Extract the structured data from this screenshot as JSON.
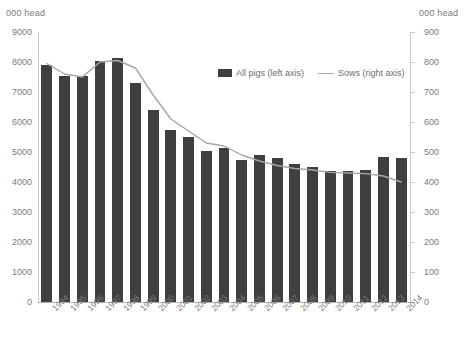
{
  "axes": {
    "left_unit_label": "000 head",
    "right_unit_label": "000 head"
  },
  "legend": {
    "items": [
      {
        "label": "All pigs (left axis)",
        "marker": "bar-swatch",
        "color": "#3f3f3f"
      },
      {
        "label": "Sows (right axis)",
        "marker": "line-swatch",
        "color": "#a6a6a6"
      }
    ]
  },
  "chart_data": {
    "type": "bar",
    "title": "",
    "subtitle": "",
    "xlabel": "",
    "ylabel": "000 head",
    "y2label": "000 head",
    "ylim": [
      0,
      9000
    ],
    "y2lim": [
      0,
      900
    ],
    "yticks": [
      0,
      1000,
      2000,
      3000,
      4000,
      5000,
      6000,
      7000,
      8000,
      9000
    ],
    "y2ticks": [
      0,
      100,
      200,
      300,
      400,
      500,
      600,
      700,
      800,
      900
    ],
    "grid": false,
    "legend_position": "top-center",
    "categories": [
      "1994",
      "1995",
      "1996",
      "1997",
      "1998",
      "1999",
      "2000",
      "2001",
      "2002",
      "2003",
      "2004",
      "2005",
      "2006",
      "2007",
      "2008",
      "2009",
      "2010",
      "2011",
      "2012",
      "2013",
      "2014"
    ],
    "series": [
      {
        "name": "All pigs (left axis)",
        "type": "bar",
        "axis": "left",
        "color": "#3f3f3f",
        "values": [
          7900,
          7550,
          7540,
          8050,
          8120,
          7300,
          6400,
          5750,
          5500,
          5050,
          5150,
          4750,
          4900,
          4800,
          4600,
          4500,
          4370,
          4370,
          4400,
          4850,
          4800
        ]
      },
      {
        "name": "Sows (right axis)",
        "type": "line",
        "axis": "right",
        "color": "#a6a6a6",
        "values": [
          795,
          760,
          750,
          800,
          805,
          780,
          690,
          610,
          570,
          530,
          520,
          490,
          470,
          455,
          445,
          440,
          432,
          430,
          428,
          420,
          400
        ]
      }
    ]
  }
}
